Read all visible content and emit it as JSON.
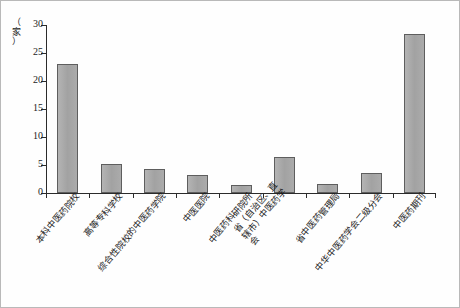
{
  "chart_data": {
    "type": "bar",
    "title": "",
    "subtitle": "",
    "xlabel": "",
    "ylabel": "（家）",
    "ylim": [
      0,
      30
    ],
    "yticks": [
      0,
      5,
      10,
      15,
      20,
      25,
      30
    ],
    "ytick_labels": [
      "0",
      "5",
      "10",
      "15",
      "20",
      "25",
      "30"
    ],
    "grid": false,
    "legend": null,
    "bar_color": "#a8a8a8",
    "bar_edge_color": "#5e5e5e",
    "axis_color": "#2b2b2b",
    "categories": [
      "本科中医药院校",
      "高等专科学校",
      "综合性院校的中医药学院",
      "中医医院",
      "中医药科研院所",
      "省（自治区、直辖市）中医药学会",
      "省中医药管理局",
      "中华中医药学会二级分会",
      "中医药期刊"
    ],
    "values": [
      23,
      5.2,
      4.2,
      3.2,
      1.4,
      6.4,
      1.6,
      3.6,
      28.4
    ],
    "unit": "家"
  },
  "axis": {
    "y_unit_label": "（家）",
    "y_unit_chars": [
      "（",
      "家",
      "）"
    ]
  }
}
